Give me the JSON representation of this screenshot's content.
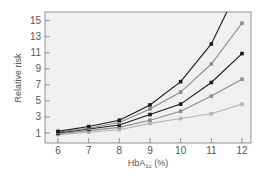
{
  "chart_data": {
    "type": "line",
    "title": "",
    "xlabel": "HbA1c (%)",
    "xlabel_main": "HbA",
    "xlabel_sub": "1c",
    "xlabel_suffix": " (%)",
    "ylabel": "Relative risk",
    "x": [
      6,
      7,
      8,
      9,
      10,
      11,
      12
    ],
    "xlim": [
      5.6,
      12.3
    ],
    "ylim": [
      -0.5,
      16.3
    ],
    "yticks": [
      1,
      3,
      5,
      7,
      9,
      11,
      13,
      15
    ],
    "xticks": [
      6,
      7,
      8,
      9,
      10,
      11,
      12
    ],
    "grid": false,
    "legend": null,
    "series": [
      {
        "name": "Series 1",
        "color": "#1a1a1a",
        "values": [
          1.2,
          1.8,
          2.6,
          4.5,
          7.4,
          12.1,
          20.0
        ]
      },
      {
        "name": "Series 2",
        "color": "#8c8c8c",
        "values": [
          1.1,
          1.6,
          2.3,
          4.0,
          6.1,
          9.6,
          14.7
        ]
      },
      {
        "name": "Series 3",
        "color": "#1a1a1a",
        "values": [
          1.0,
          1.5,
          2.0,
          3.3,
          4.6,
          7.3,
          10.9
        ]
      },
      {
        "name": "Series 4",
        "color": "#8c8c8c",
        "values": [
          0.9,
          1.3,
          1.7,
          2.6,
          3.7,
          5.6,
          7.7
        ]
      },
      {
        "name": "Series 5",
        "color": "#b4b4b4",
        "values": [
          0.8,
          1.1,
          1.4,
          2.2,
          2.8,
          3.4,
          4.6
        ]
      }
    ]
  },
  "colors": {
    "plot_background": "#f0f0f0",
    "axis": "#7a7a7a"
  }
}
